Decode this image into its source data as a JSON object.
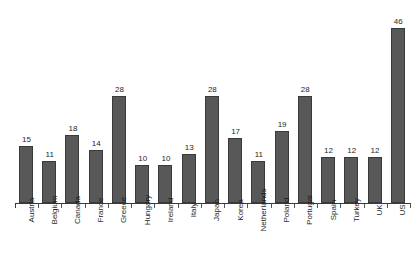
{
  "chart_data": {
    "type": "bar",
    "title": "",
    "xlabel": "",
    "ylabel": "",
    "ylim": [
      0,
      50
    ],
    "grid": false,
    "legend": null,
    "orientation": "vertical",
    "data_labels_shown": true,
    "y_axis_visible": false,
    "x_axis_visible": true,
    "bar_color": "#585858",
    "bar_border_color": "#3a3a3a",
    "background_color": "#ffffff",
    "categories": [
      "Austria",
      "Belgium",
      "Canada",
      "France",
      "Greece",
      "Hungary",
      "Ireland",
      "Italy",
      "Japan",
      "Korea",
      "Netherlands",
      "Poland",
      "Portugal",
      "Spain",
      "Turkey",
      "UK",
      "US"
    ],
    "values": [
      15,
      11,
      18,
      14,
      28,
      10,
      10,
      13,
      28,
      17,
      11,
      19,
      28,
      12,
      12,
      12,
      46
    ],
    "value_labels": [
      "15",
      "11",
      "18",
      "14",
      "28",
      "10",
      "10",
      "13",
      "28",
      "17",
      "11",
      "19",
      "28",
      "12",
      "12",
      "12",
      "46"
    ]
  },
  "title_remnant": {
    "text": "_"
  }
}
